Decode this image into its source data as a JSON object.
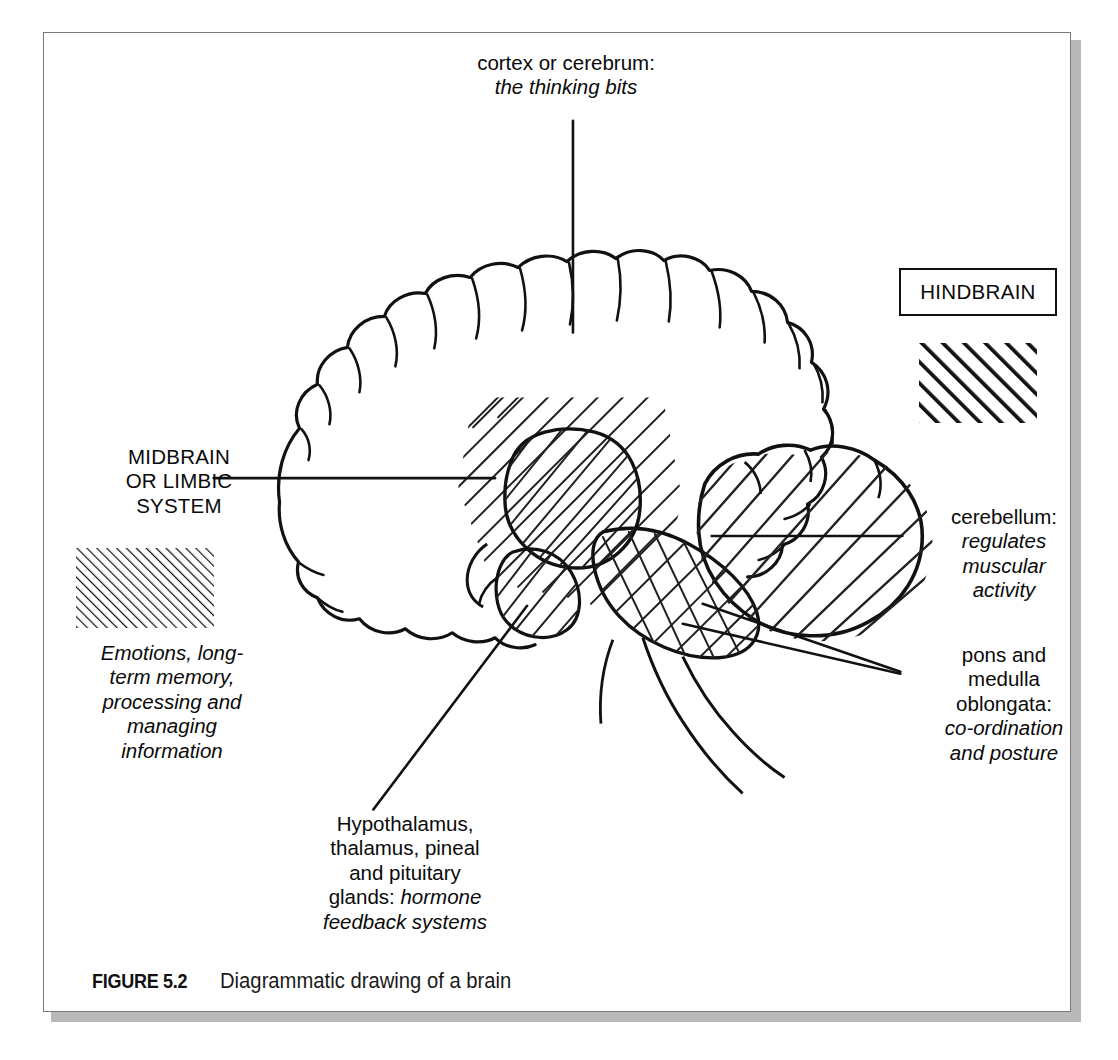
{
  "figure": {
    "caption_number": "FIGURE 5.2",
    "caption_text": "Diagrammatic drawing of a brain"
  },
  "labels": {
    "cortex": {
      "title": "cortex or cerebrum:",
      "subtitle": "the thinking bits"
    },
    "midbrain": {
      "title": "MIDBRAIN\nOR LIMBIC\nSYSTEM",
      "description": "Emotions, long-\nterm memory,\nprocessing and\nmanaging\ninformation",
      "swatch_name": "fine-diagonal-hatch"
    },
    "hindbrain": {
      "title": "HINDBRAIN",
      "swatch_name": "bold-diagonal-hatch"
    },
    "cerebellum": {
      "title": "cerebellum:",
      "subtitle": "regulates\nmuscular\nactivity"
    },
    "pons": {
      "title": "pons and\nmedulla\noblongata:",
      "subtitle": "co-ordination\nand posture"
    },
    "hypothalamus": {
      "title": "Hypothalamus,\nthalamus, pineal\nand pituitary\nglands:",
      "subtitle": "hormone\nfeedback systems"
    }
  },
  "colors": {
    "ink": "#111111",
    "frame": "#77797c",
    "shadow": "#b9b9b9",
    "background": "#ffffff"
  }
}
